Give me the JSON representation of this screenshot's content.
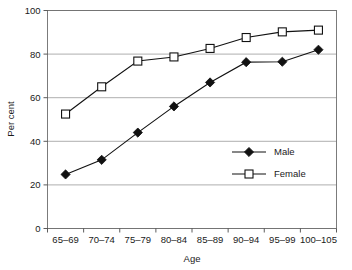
{
  "chart_data": {
    "type": "line",
    "title": "",
    "xlabel": "Age",
    "ylabel": "Per cent",
    "categories": [
      "65–69",
      "70–74",
      "75–79",
      "80–84",
      "85–89",
      "90–94",
      "95–99",
      "100–105"
    ],
    "ylim": [
      0,
      100
    ],
    "yticks": [
      0,
      20,
      40,
      60,
      80,
      100
    ],
    "ytick_labels": [
      "0",
      "20",
      "40",
      "60",
      "80",
      "100"
    ],
    "grid": true,
    "grid_axis": "y",
    "legend_position": "inside-lower-right",
    "series": [
      {
        "name": "Male",
        "marker": "filled-diamond",
        "color": "#111111",
        "values": [
          24.8,
          31.5,
          44.0,
          56.0,
          67.0,
          76.3,
          76.5,
          82.0
        ]
      },
      {
        "name": "Female",
        "marker": "open-square",
        "color": "#111111",
        "values": [
          52.5,
          65.0,
          76.8,
          78.7,
          82.6,
          87.6,
          90.2,
          91.0
        ]
      }
    ]
  },
  "legend": {
    "entries": [
      {
        "label": "Male"
      },
      {
        "label": "Female"
      }
    ]
  }
}
